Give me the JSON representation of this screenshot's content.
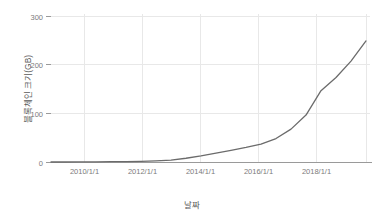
{
  "chart_data": {
    "type": "line",
    "title": "",
    "xlabel": "날짜",
    "ylabel": "블록체인 크기(GB)",
    "ylim": [
      0,
      310
    ],
    "yticks": [
      0,
      100,
      200,
      300
    ],
    "ytick_labels": [
      "0",
      "100",
      "200",
      "300"
    ],
    "xtick_labels": [
      "2010/1/1",
      "2012/1/1",
      "2014/1/1",
      "2016/1/1",
      "2018/1/1"
    ],
    "xlim": [
      "2009-01-01",
      "2019-07-01"
    ],
    "grid": true,
    "legend": false,
    "series": [
      {
        "name": "블록체인 크기(GB)",
        "color": "#6b6b6b",
        "x": [
          "2009/1/1",
          "2009/7/1",
          "2010/1/1",
          "2010/7/1",
          "2011/1/1",
          "2011/7/1",
          "2012/1/1",
          "2012/7/1",
          "2013/1/1",
          "2013/7/1",
          "2014/1/1",
          "2014/7/1",
          "2015/1/1",
          "2015/7/1",
          "2016/1/1",
          "2016/7/1",
          "2017/1/1",
          "2017/7/1",
          "2018/1/1",
          "2018/7/1",
          "2019/1/1",
          "2019/7/1"
        ],
        "values": [
          0,
          0,
          0.1,
          0.3,
          0.6,
          1,
          1.5,
          2.5,
          4,
          8,
          13,
          19,
          25,
          31,
          38,
          50,
          70,
          100,
          152,
          180,
          215,
          258
        ]
      }
    ]
  },
  "axis": {
    "y_label": "블록체인 크기(GB)",
    "x_label": "날짜"
  }
}
